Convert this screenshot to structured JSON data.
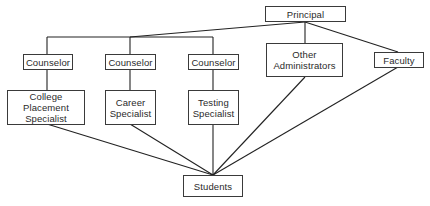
{
  "diagram": {
    "type": "organization-chart",
    "colors": {
      "line": "#222222",
      "box_border": "#3a3a3a",
      "text": "#2a2a2a",
      "background": "#ffffff"
    },
    "nodes": {
      "principal": {
        "label": "Principal"
      },
      "counselor1": {
        "label": "Counselor"
      },
      "counselor2": {
        "label": "Counselor"
      },
      "counselor3": {
        "label": "Counselor"
      },
      "other_admin": {
        "label": "Other\nAdministrators"
      },
      "faculty": {
        "label": "Faculty"
      },
      "college_placement": {
        "label": "College Placement\nSpecialist"
      },
      "career": {
        "label": "Career\nSpecialist"
      },
      "testing": {
        "label": "Testing\nSpecialist"
      },
      "students": {
        "label": "Students"
      }
    },
    "edges": [
      [
        "Principal",
        "Counselor (1)"
      ],
      [
        "Principal",
        "Counselor (2)"
      ],
      [
        "Principal",
        "Counselor (3)"
      ],
      [
        "Principal",
        "Other Administrators"
      ],
      [
        "Principal",
        "Faculty"
      ],
      [
        "Counselor (1)",
        "College Placement Specialist"
      ],
      [
        "Counselor (2)",
        "Career Specialist"
      ],
      [
        "Counselor (3)",
        "Testing Specialist"
      ],
      [
        "College Placement Specialist",
        "Students"
      ],
      [
        "Career Specialist",
        "Students"
      ],
      [
        "Testing Specialist",
        "Students"
      ],
      [
        "Other Administrators",
        "Students"
      ],
      [
        "Faculty",
        "Students"
      ]
    ]
  }
}
